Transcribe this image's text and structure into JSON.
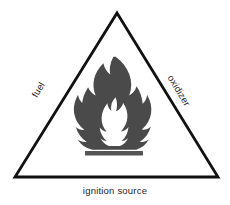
{
  "figure": {
    "name": "fire-triangle",
    "background_color": "#ffffff"
  },
  "triangle": {
    "stroke_color": "#111111",
    "fill_color": "#ffffff",
    "stroke_width": 2.8,
    "apex": {
      "x": 117,
      "y": 13
    },
    "bottom_left": {
      "x": 15,
      "y": 177
    },
    "bottom_right": {
      "x": 218,
      "y": 177
    }
  },
  "labels": {
    "left_edge": "fuel",
    "right_edge": "oxidizer",
    "bottom_edge": "ignition source",
    "text_color": "#1d1d1d"
  },
  "icon": {
    "name": "flame-icon",
    "flame_color": "#4a4a4a",
    "bar_color": "#555555",
    "bar": {
      "x": 85,
      "y": 151,
      "width": 58,
      "height": 4.5
    }
  }
}
